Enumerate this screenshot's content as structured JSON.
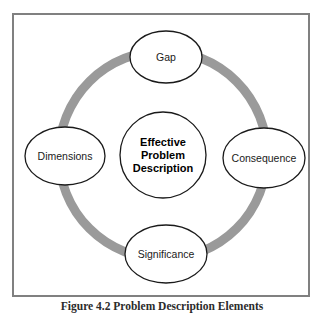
{
  "figure": {
    "caption": "Figure 4.2 Problem Description Elements",
    "frame_border_color": "#808080",
    "background_color": "#ffffff"
  },
  "diagram": {
    "type": "cycle-ring",
    "ring": {
      "name": "gray-cycle-ring",
      "color": "#9a9a9a",
      "stroke_width": 9,
      "center_x": 149,
      "center_y": 140,
      "radius": 104
    },
    "center_node": {
      "label_lines": [
        "Effective",
        "Problem",
        "Description"
      ],
      "label": "Effective Problem Description",
      "shape": "circle",
      "radius": 43,
      "cx": 149,
      "cy": 140,
      "stroke_color": "#1a1a1a",
      "fill": "#ffffff",
      "bold": true
    },
    "nodes": [
      {
        "id": "gap",
        "label": "Gap",
        "position": "top",
        "cx": 152,
        "cy": 42,
        "rx": 36,
        "ry": 26,
        "shape": "ellipse",
        "stroke_color": "#1a1a1a",
        "fill": "#ffffff"
      },
      {
        "id": "consequence",
        "label": "Consequence",
        "position": "right",
        "cx": 250,
        "cy": 143,
        "rx": 41,
        "ry": 30,
        "shape": "ellipse",
        "stroke_color": "#1a1a1a",
        "fill": "#ffffff"
      },
      {
        "id": "significance",
        "label": "Significance",
        "position": "bottom",
        "cx": 152,
        "cy": 239,
        "rx": 41,
        "ry": 29,
        "shape": "ellipse",
        "stroke_color": "#1a1a1a",
        "fill": "#ffffff"
      },
      {
        "id": "dimensions",
        "label": "Dimensions",
        "position": "left",
        "cx": 51,
        "cy": 141,
        "rx": 40,
        "ry": 29,
        "shape": "ellipse",
        "stroke_color": "#1a1a1a",
        "fill": "#ffffff"
      }
    ]
  }
}
